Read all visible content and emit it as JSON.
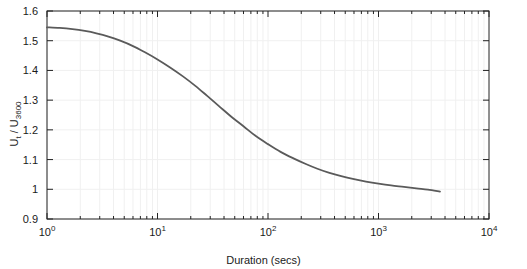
{
  "chart_data": {
    "type": "line",
    "title": "",
    "xlabel": "Duration (secs)",
    "ylabel_parts": {
      "numerator": "U",
      "numerator_sub": "t",
      "separator": " / ",
      "denominator": "U",
      "denominator_sub": "3600"
    },
    "ylabel_plain": "U_t / U_3600",
    "xscale": "log",
    "yscale": "linear",
    "xlim": [
      1,
      10000
    ],
    "ylim": [
      0.9,
      1.6
    ],
    "xtick_values": [
      1,
      10,
      100,
      1000,
      10000
    ],
    "xtick_labels": [
      "10^0",
      "10^1",
      "10^2",
      "10^3",
      "10^4"
    ],
    "xtick_mantissas": [
      "10",
      "10",
      "10",
      "10",
      "10"
    ],
    "xtick_exponents": [
      "0",
      "1",
      "2",
      "3",
      "4"
    ],
    "ytick_values": [
      0.9,
      1.0,
      1.1,
      1.2,
      1.3,
      1.4,
      1.5,
      1.6
    ],
    "ytick_labels": [
      "0.9",
      "1",
      "1.1",
      "1.2",
      "1.3",
      "1.4",
      "1.5",
      "1.6"
    ],
    "grid": true,
    "grid_color": "#f0f0f0",
    "legend": null,
    "series": [
      {
        "name": "gust factor curve",
        "color": "#5a5a5a",
        "line_width": 1.8,
        "x": [
          1,
          1.3,
          1.7,
          2.2,
          2.8,
          3.6,
          4.6,
          6,
          7.7,
          10,
          13,
          17,
          22,
          28,
          36,
          46,
          60,
          77,
          100,
          130,
          170,
          220,
          280,
          360,
          460,
          600,
          770,
          1000,
          1300,
          1700,
          2200,
          2800,
          3600
        ],
        "y": [
          1.545,
          1.543,
          1.539,
          1.533,
          1.525,
          1.514,
          1.5,
          1.482,
          1.461,
          1.437,
          1.41,
          1.38,
          1.348,
          1.315,
          1.28,
          1.246,
          1.212,
          1.18,
          1.152,
          1.126,
          1.104,
          1.085,
          1.069,
          1.055,
          1.044,
          1.034,
          1.026,
          1.019,
          1.013,
          1.008,
          1.003,
          0.999,
          0.992
        ]
      }
    ]
  },
  "plot_geometry": {
    "left": 47,
    "right": 489,
    "top": 11,
    "bottom": 219,
    "axis_color": "#222222",
    "background": "#ffffff"
  }
}
